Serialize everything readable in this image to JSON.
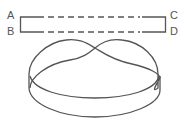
{
  "diagram": {
    "type": "mobius-strip-construction",
    "strip": {
      "corners": {
        "top_left": "A",
        "bottom_left": "B",
        "top_right": "C",
        "bottom_right": "D"
      },
      "edge_style": "solid ends, dashed middle"
    },
    "band": {
      "description": "strip joined with a half twist",
      "twist_count": 1
    },
    "colors": {
      "stroke": "#555555",
      "background": "#ffffff"
    }
  }
}
